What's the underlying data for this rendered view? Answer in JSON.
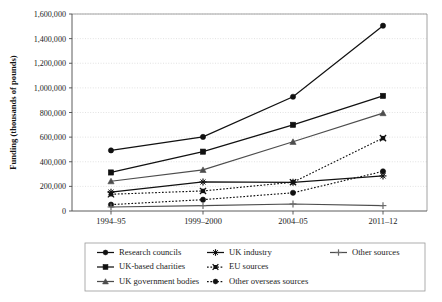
{
  "chart_data": {
    "type": "line",
    "title": "",
    "xlabel": "",
    "ylabel": "Funding (thousands of pounds)",
    "categories": [
      "1994–95",
      "1999–2000",
      "2004–05",
      "2011–12"
    ],
    "ylim": [
      0,
      1600000
    ],
    "y_ticks": [
      0,
      200000,
      400000,
      600000,
      800000,
      1000000,
      1200000,
      1400000,
      1600000
    ],
    "y_tick_labels": [
      "0",
      "200,000",
      "400,000",
      "600,000",
      "800,000",
      "1,000,000",
      "1,200,000",
      "1,400,000",
      "1,600,000"
    ],
    "grid": true,
    "legend_position": "bottom",
    "series": [
      {
        "name": "Research councils",
        "marker": "circle",
        "line_style": "solid",
        "color": "#111111",
        "values": [
          492000,
          602000,
          928000,
          1505000
        ]
      },
      {
        "name": "UK-based charities",
        "marker": "square",
        "line_style": "solid",
        "color": "#111111",
        "values": [
          313000,
          482000,
          700000,
          935000
        ]
      },
      {
        "name": "UK government bodies",
        "marker": "triangle",
        "line_style": "solid",
        "color": "#4d4d4d",
        "values": [
          242000,
          334000,
          562000,
          795000
        ]
      },
      {
        "name": "UK industry",
        "marker": "asterisk",
        "line_style": "solid",
        "color": "#111111",
        "values": [
          153000,
          236000,
          233000,
          285000
        ]
      },
      {
        "name": "EU sources",
        "marker": "cross-box",
        "line_style": "dotted",
        "color": "#111111",
        "values": [
          136000,
          163000,
          234000,
          592000
        ]
      },
      {
        "name": "Other overseas sources",
        "marker": "circle",
        "line_style": "dotted",
        "color": "#111111",
        "values": [
          52000,
          92000,
          148000,
          322000
        ]
      },
      {
        "name": "Other sources",
        "marker": "plus",
        "line_style": "solid",
        "color": "#6a6a6a",
        "values": [
          33000,
          44000,
          57000,
          44000
        ]
      }
    ]
  },
  "legend": {
    "entries": [
      {
        "label": "Research councils"
      },
      {
        "label": "UK industry"
      },
      {
        "label": "Other sources"
      },
      {
        "label": "UK-based charities"
      },
      {
        "label": "EU sources"
      },
      {
        "label": "UK government bodies"
      },
      {
        "label": "Other overseas sources"
      }
    ]
  }
}
